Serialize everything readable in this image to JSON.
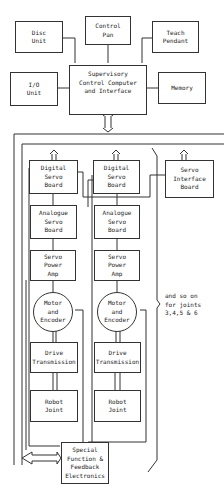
{
  "diagram": {
    "top": {
      "disc_unit": "Disc\nUnit",
      "control_pan": "Control\nPan",
      "teach_pendant": "Teach\nPendant",
      "io_unit": "I/O\nUnit",
      "supervisory": "Supervisory\nControl Computer\nand Interface",
      "memory": "Memory"
    },
    "joint_columns": [
      {
        "digital_servo": "Digital\nServo\nBoard",
        "analogue_servo": "Analogue\nServo\nBoard",
        "servo_power": "Servo\nPower\nAmp",
        "motor": "Motor\nand\nEncoder",
        "drive": "Drive\nTransmission",
        "joint": "Robot\nJoint"
      },
      {
        "digital_servo": "Digital\nServo\nBoard",
        "analogue_servo": "Analogue\nServo\nBoard",
        "servo_power": "Servo\nPower\nAmp",
        "motor": "Motor\nand\nEncoder",
        "drive": "Drive\nTransmission",
        "joint": "Robot\nJoint"
      }
    ],
    "servo_interface": "Servo\nInterface\nBoard",
    "note": "and so on\nfor joints\n3,4,5 & 6",
    "special_function": "Special\nFunction &\nFeedback\nElectronics"
  }
}
